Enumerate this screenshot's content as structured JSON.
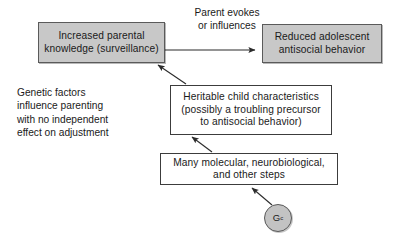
{
  "diagram": {
    "nodes": {
      "parental_knowledge": {
        "label": "Increased parental\nknowledge (surveillance)",
        "fill": "#c8c8c8",
        "shape": "rectangle"
      },
      "adolescent_behavior": {
        "label": "Reduced adolescent\nantisocial behavior",
        "fill": "#c8c8c8",
        "shape": "rectangle"
      },
      "heritable_characteristics": {
        "label": "Heritable child characteristics\n(possibly a troubling precursor\nto antisocial behavior)",
        "fill": "#ffffff",
        "shape": "rectangle"
      },
      "molecular_steps": {
        "label": "Many molecular, neurobiological,\nand other steps",
        "fill": "#ffffff",
        "shape": "rectangle"
      },
      "genotype": {
        "label": "G",
        "subscript": "c",
        "fill": "#c3c3c3",
        "shape": "circle"
      }
    },
    "edge_labels": {
      "parent_evokes": "Parent evokes\nor influences"
    },
    "annotations": {
      "genetic_factors": "Genetic factors\ninfluence parenting\nwith no independent\neffect on adjustment"
    },
    "edges": [
      {
        "from": "parental_knowledge",
        "to": "adolescent_behavior",
        "style": "solid-arrow",
        "label": "Parent evokes or influences"
      },
      {
        "from": "heritable_characteristics",
        "to": "parental_knowledge",
        "style": "solid-arrow",
        "label": ""
      },
      {
        "from": "molecular_steps",
        "to": "heritable_characteristics",
        "style": "solid-arrow",
        "label": ""
      },
      {
        "from": "genotype",
        "to": "molecular_steps",
        "style": "solid-arrow",
        "label": ""
      }
    ],
    "colors": {
      "stroke": "#3c3c3c",
      "shaded_fill": "#c8c8c8",
      "plain_fill": "#ffffff",
      "text": "#1a1a1a",
      "background": "#ffffff"
    }
  }
}
